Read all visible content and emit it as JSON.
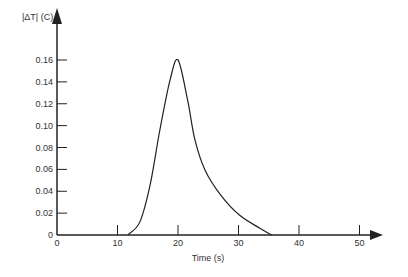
{
  "chart_data": {
    "type": "line",
    "title": "",
    "xlabel": "Time (s)",
    "ylabel": "|ΔT| (C)",
    "xlim": [
      0,
      50
    ],
    "ylim": [
      0,
      0.16
    ],
    "grid": false,
    "legend": null,
    "x_ticks": [
      "0",
      "10",
      "20",
      "30",
      "40",
      "50"
    ],
    "y_ticks": [
      "0",
      "0.02",
      "0.04",
      "0.06",
      "0.08",
      "0.10",
      "0.12",
      "0.14",
      "0.16"
    ],
    "series": [
      {
        "name": "|ΔT|",
        "color": "#222222",
        "x": [
          11.7,
          13.7,
          15.4,
          17.0,
          18.7,
          20.0,
          21.6,
          22.8,
          24.5,
          27.0,
          30.2,
          33.6,
          35.5
        ],
        "y": [
          0.0,
          0.012,
          0.046,
          0.096,
          0.142,
          0.16,
          0.123,
          0.087,
          0.059,
          0.037,
          0.018,
          0.006,
          0.0
        ]
      }
    ]
  }
}
